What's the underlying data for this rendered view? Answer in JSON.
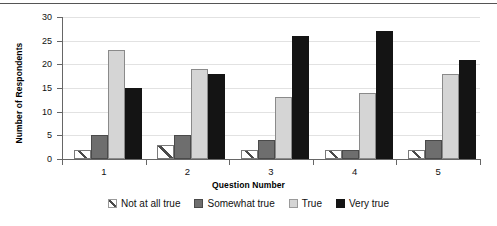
{
  "chart_data": {
    "type": "bar",
    "title": "",
    "subtitle": "",
    "xlabel": "Question Number",
    "ylabel": "Number of Respondents",
    "categories": [
      "1",
      "2",
      "3",
      "4",
      "5"
    ],
    "series": [
      {
        "name": "Not at all true",
        "color": "#ffffff",
        "pattern": "diagonal-hatch",
        "values": [
          2,
          3,
          2,
          2,
          2
        ]
      },
      {
        "name": "Somewhat true",
        "color": "#6e6e6e",
        "pattern": "solid",
        "values": [
          5,
          5,
          4,
          2,
          4
        ]
      },
      {
        "name": "True",
        "color": "#d5d5d5",
        "pattern": "solid",
        "values": [
          23,
          19,
          13,
          14,
          18
        ]
      },
      {
        "name": "Very true",
        "color": "#141414",
        "pattern": "solid",
        "values": [
          15,
          18,
          26,
          27,
          21
        ]
      }
    ],
    "ylim": [
      0,
      30
    ],
    "ytick_values": [
      0,
      5,
      10,
      15,
      20,
      25,
      30
    ],
    "ytick_labels": [
      "0",
      "5",
      "10",
      "15",
      "20",
      "25",
      "30"
    ],
    "grid": "horizontal",
    "legend_position": "bottom"
  },
  "legend": {
    "items": [
      {
        "label": "Not at all true"
      },
      {
        "label": "Somewhat true"
      },
      {
        "label": "True"
      },
      {
        "label": "Very true"
      }
    ]
  }
}
